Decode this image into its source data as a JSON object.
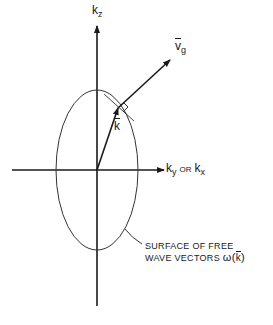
{
  "figure": {
    "axes": {
      "vertical_label": {
        "base": "k",
        "sub": "z"
      },
      "horizontal_label": {
        "base1": "k",
        "sub1": "y",
        "connector": "OR",
        "base2": "k",
        "sub2": "x"
      }
    },
    "vectors": {
      "k_label": "k",
      "vg_label": {
        "base": "v",
        "sub": "g"
      }
    },
    "caption": {
      "line1": "SURFACE OF FREE",
      "line2_text": "WAVE VECTORS",
      "line2_symbol": "ω(",
      "line2_vec": "k",
      "line2_close": ")"
    },
    "colors": {
      "ink": "#1a1a1a",
      "background": "#ffffff"
    }
  }
}
